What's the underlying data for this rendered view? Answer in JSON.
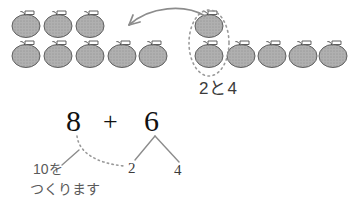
{
  "page": {
    "width": 350,
    "height": 204,
    "background": "#ffffff",
    "kind": "math-worksheet-illustration"
  },
  "colors": {
    "apple_fill": "#a8a8a8",
    "apple_stroke": "#5a5a5a",
    "leaf_fill": "#ffffff",
    "arrow": "#8c8c8c",
    "dotted_oval": "#9a9a9a",
    "equation_text": "#111111",
    "annotation_text": "#5a5a5a",
    "branch_line": "#8c8c8c"
  },
  "apple_groups": [
    {
      "name": "left-group",
      "total": 8,
      "rows": [
        {
          "count": 3,
          "y": 26,
          "x_start": 26,
          "x_step": 32
        },
        {
          "count": 5,
          "y": 56,
          "x_start": 26,
          "x_step": 32
        }
      ]
    },
    {
      "name": "right-group",
      "total": 6,
      "rows": [
        {
          "count": 1,
          "y": 26,
          "x_start": 209,
          "x_step": 32
        },
        {
          "count": 5,
          "y": 56,
          "x_start": 209,
          "x_step": 32
        }
      ]
    }
  ],
  "annotations": {
    "move_arrow": {
      "name": "move-two-apples-arrow",
      "from": "right-group",
      "to": "left-group"
    },
    "dotted_oval": {
      "name": "grouping-oval",
      "encircled_count": 2,
      "cx": 209,
      "cy": 41,
      "rx": 19,
      "ry": 32
    },
    "group_label": "2と4"
  },
  "equation": {
    "left": "8",
    "operator": "+",
    "right": "6",
    "decomposition": {
      "part_a": "2",
      "part_b": "4"
    }
  },
  "hint": {
    "line1": "10を",
    "line2": "つくります"
  }
}
